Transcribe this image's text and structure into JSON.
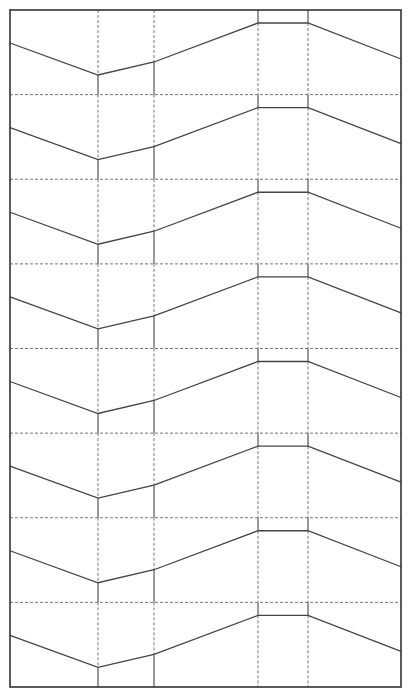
{
  "diagram": {
    "type": "repeating-band-pattern",
    "width": 408,
    "height": 691,
    "frame": {
      "x0": 10,
      "y0": 10,
      "x1": 401,
      "y1": 687,
      "color": "#333333",
      "stroke_width": 1.6
    },
    "band_count": 8,
    "band_height": 84.625,
    "colors": {
      "solid_line": "#555555",
      "dashed_line": "#777777",
      "polyline": "#444444",
      "background": "#ffffff"
    },
    "polyline_profile": [
      {
        "x": 10,
        "dy": 33
      },
      {
        "x": 98,
        "dy": 65
      },
      {
        "x": 154,
        "dy": 52
      },
      {
        "x": 258,
        "dy": 13
      },
      {
        "x": 308,
        "dy": 13
      },
      {
        "x": 401,
        "dy": 49
      }
    ],
    "verticals": [
      {
        "x": 98,
        "above_polyline": "dashed",
        "below_polyline": "solid"
      },
      {
        "x": 154,
        "above_polyline": "dashed",
        "below_polyline": "solid"
      },
      {
        "x": 258,
        "above_polyline": "solid",
        "below_polyline": "dashed"
      },
      {
        "x": 308,
        "above_polyline": "solid",
        "below_polyline": "dashed"
      }
    ],
    "band_separator_style": "dashed"
  }
}
